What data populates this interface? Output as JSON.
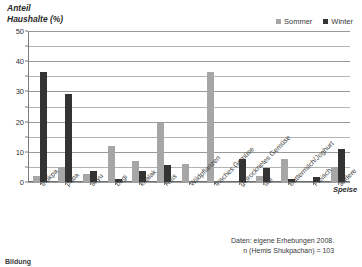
{
  "yaxis_title": {
    "line1": "Anteil",
    "line2": "Haushalte (%)"
  },
  "xaxis_title": "Speise",
  "legend": {
    "items": [
      {
        "label": "Sommer",
        "color": "#a6a6a6",
        "icon": "legend-swatch-icon"
      },
      {
        "label": "Winter",
        "color": "#333333",
        "icon": "legend-swatch-icon"
      }
    ]
  },
  "source_note": {
    "line1": "Daten: eigene Erhebungen 2008.",
    "line2": "n (Hemis Shukpachan) = 103"
  },
  "caption": "Bildung",
  "chart_data": {
    "type": "bar",
    "title": "",
    "subtitle": "",
    "xlabel": "Speise",
    "ylabel": "Anteil Haushalte (%)",
    "ylim": [
      0,
      50
    ],
    "yticks": [
      0,
      10,
      20,
      30,
      40,
      50
    ],
    "y_minor_step": 5,
    "grid": true,
    "legend_position": "top-right",
    "categories": [
      "thukpa",
      "paba",
      "skyu",
      "bagi",
      "khalak",
      "Reis",
      "Wildpflanzen",
      "frisches Gemüse",
      "getrocknetes Gemüse",
      "dal",
      "Buttermilch/Joghurt",
      "Fleisch",
      "andere"
    ],
    "series": [
      {
        "name": "Sommer",
        "color": "#a6a6a6",
        "values": [
          2,
          5,
          2.5,
          12,
          7,
          19.5,
          6,
          36.5,
          0,
          2,
          7.5,
          0,
          5
        ]
      },
      {
        "name": "Winter",
        "color": "#333333",
        "values": [
          36.5,
          29,
          3.5,
          1,
          3.5,
          5.5,
          0,
          0,
          7.5,
          4.5,
          1,
          1.5,
          11
        ]
      }
    ],
    "annotations": [
      "Daten: eigene Erhebungen 2008.",
      "n (Hemis Shukpachan) = 103"
    ]
  }
}
